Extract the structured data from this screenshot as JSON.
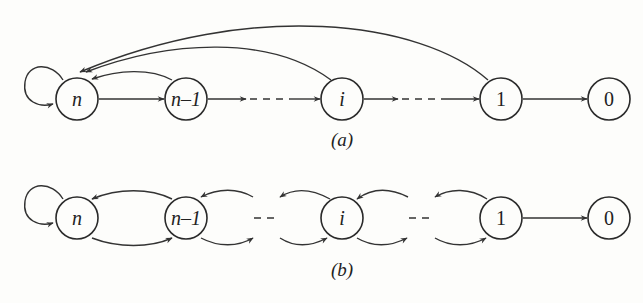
{
  "figure_a": {
    "caption": "(a)",
    "nodes": [
      {
        "id": "n",
        "label": "n",
        "italic": true
      },
      {
        "id": "n-1",
        "label": "n–1",
        "italic": true
      },
      {
        "id": "i",
        "label": "i",
        "italic": true
      },
      {
        "id": "1",
        "label": "1",
        "italic": false
      },
      {
        "id": "0",
        "label": "0",
        "italic": false
      }
    ],
    "edges": [
      {
        "from": "n",
        "to": "n",
        "type": "self-loop"
      },
      {
        "from": "n",
        "to": "n-1",
        "type": "forward"
      },
      {
        "from": "n-1",
        "to": "i",
        "type": "forward-dashed"
      },
      {
        "from": "i",
        "to": "1",
        "type": "forward-dashed"
      },
      {
        "from": "1",
        "to": "0",
        "type": "forward"
      },
      {
        "from": "n-1",
        "to": "n",
        "type": "back-arc"
      },
      {
        "from": "i",
        "to": "n",
        "type": "back-arc"
      },
      {
        "from": "1",
        "to": "n",
        "type": "back-arc"
      }
    ]
  },
  "figure_b": {
    "caption": "(b)",
    "nodes": [
      {
        "id": "n",
        "label": "n",
        "italic": true
      },
      {
        "id": "n-1",
        "label": "n–1",
        "italic": true
      },
      {
        "id": "i",
        "label": "i",
        "italic": true
      },
      {
        "id": "1",
        "label": "1",
        "italic": false
      },
      {
        "id": "0",
        "label": "0",
        "italic": false
      }
    ],
    "edges": [
      {
        "from": "n",
        "to": "n",
        "type": "self-loop"
      },
      {
        "from": "n",
        "to": "n-1",
        "type": "lower-arc"
      },
      {
        "from": "n-1",
        "to": "n",
        "type": "upper-arc"
      },
      {
        "from": "n-1",
        "to": "...",
        "type": "lower-arc"
      },
      {
        "from": "...",
        "to": "n-1",
        "type": "upper-arc"
      },
      {
        "from": "...",
        "to": "i",
        "type": "lower-arc"
      },
      {
        "from": "i",
        "to": "...",
        "type": "upper-arc"
      },
      {
        "from": "i",
        "to": "...",
        "type": "lower-arc"
      },
      {
        "from": "...",
        "to": "i",
        "type": "upper-arc"
      },
      {
        "from": "...",
        "to": "1",
        "type": "lower-arc"
      },
      {
        "from": "1",
        "to": "...",
        "type": "upper-arc"
      },
      {
        "from": "1",
        "to": "0",
        "type": "forward"
      }
    ],
    "ellipsis": [
      "---",
      "---"
    ]
  }
}
